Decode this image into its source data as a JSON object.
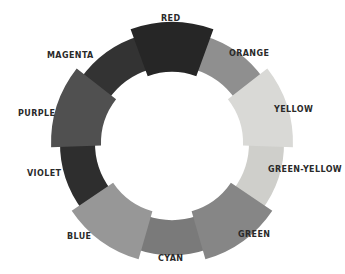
{
  "diagram": {
    "type": "color-wheel",
    "center": [
      172,
      143
    ],
    "segments": [
      {
        "name": "RED",
        "color": "#262626",
        "large": true,
        "label_pos": [
          161,
          14
        ]
      },
      {
        "name": "ORANGE",
        "color": "#8f8f8f",
        "large": false,
        "label_pos": [
          229,
          49
        ]
      },
      {
        "name": "YELLOW",
        "color": "#d9d9d6",
        "large": true,
        "label_pos": [
          274,
          105
        ]
      },
      {
        "name": "GREEN-YELLOW",
        "color": "#cfcfcb",
        "large": false,
        "label_pos": [
          268,
          165
        ]
      },
      {
        "name": "GREEN",
        "color": "#868686",
        "large": true,
        "label_pos": [
          238,
          230
        ]
      },
      {
        "name": "CYAN",
        "color": "#7a7a7a",
        "large": false,
        "label_pos": [
          158,
          254
        ]
      },
      {
        "name": "BLUE",
        "color": "#979797",
        "large": true,
        "label_pos": [
          67,
          232
        ]
      },
      {
        "name": "VIOLET",
        "color": "#2e2e2e",
        "large": false,
        "label_pos": [
          27,
          169
        ]
      },
      {
        "name": "PURPLE",
        "color": "#505050",
        "large": true,
        "label_pos": [
          18,
          109
        ]
      },
      {
        "name": "MAGENTA",
        "color": "#333333",
        "large": false,
        "label_pos": [
          47,
          51
        ]
      }
    ]
  }
}
